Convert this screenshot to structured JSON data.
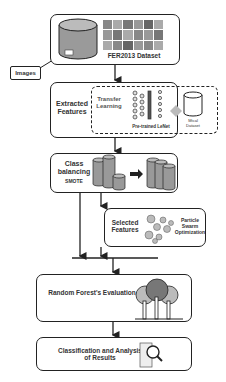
{
  "diagram": {
    "nodes": {
      "dataset": {
        "label": "FER2013 Dataset"
      },
      "images": {
        "label": "Images"
      },
      "extracted": {
        "label": "Extracted Features",
        "transfer": "Transfer Learning",
        "lenet": "Pre-trained LeNet",
        "extra_dataset": "Mtcal Dataset"
      },
      "balancing": {
        "label": "Class balancing",
        "method": "SMOTE"
      },
      "selected": {
        "label": "Selected Features",
        "method": "Particle Swarm Optimization"
      },
      "forest": {
        "label": "Random Forest's Evaluation"
      },
      "results": {
        "label": "Classification and Analysis of Results"
      }
    },
    "edges": [
      [
        "dataset",
        "extracted"
      ],
      [
        "extracted",
        "balancing"
      ],
      [
        "balancing",
        "selected"
      ],
      [
        "balancing",
        "merge"
      ],
      [
        "selected",
        "merge"
      ],
      [
        "merge",
        "forest"
      ],
      [
        "forest",
        "results"
      ]
    ]
  }
}
